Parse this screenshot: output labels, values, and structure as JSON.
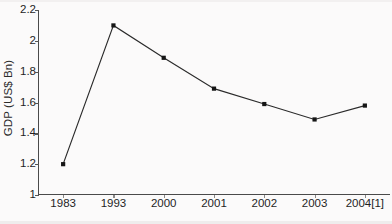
{
  "chart_data": {
    "type": "line",
    "title": "",
    "subtitle": "",
    "xlabel": "",
    "ylabel": "GDP (US$ Bn)",
    "categories": [
      "1983",
      "1993",
      "2000",
      "2001",
      "2002",
      "2003",
      "2004[1]"
    ],
    "values": [
      1.2,
      2.1,
      1.89,
      1.69,
      1.59,
      1.49,
      1.58
    ],
    "series": [
      {
        "name": "GDP (US$ Bn)",
        "values": [
          1.2,
          2.1,
          1.89,
          1.69,
          1.59,
          1.49,
          1.58
        ]
      }
    ],
    "ylim": [
      1,
      2.2
    ],
    "ytick_labels": [
      "1",
      "1.2",
      "1.4",
      "1.6",
      "1.8",
      "2",
      "2.2"
    ],
    "ytick_values": [
      1,
      1.2,
      1.4,
      1.6,
      1.8,
      2,
      2.2
    ],
    "grid": false,
    "legend": false,
    "legend_position": "none",
    "annotations": [],
    "marker": "square",
    "line_color": "#2a2a2a",
    "marker_color": "#151515",
    "background_color": "#fbfafa"
  }
}
